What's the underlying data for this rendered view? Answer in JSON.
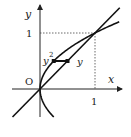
{
  "diagram": {
    "labels": {
      "y_axis": "y",
      "x_axis": "x",
      "origin": "O",
      "tick_y1": "1",
      "tick_x1": "1",
      "strip_left": "y",
      "strip_left_exp": "2",
      "strip_right": "y"
    },
    "curves": [
      {
        "name": "line",
        "equation": "y = x"
      },
      {
        "name": "parabola",
        "equation": "x = y^2"
      }
    ],
    "intersection": [
      1,
      1
    ],
    "strip": {
      "y": 0.5,
      "x_from": 0.25,
      "x_to": 0.5
    },
    "colors": {
      "ink": "#111111"
    }
  }
}
